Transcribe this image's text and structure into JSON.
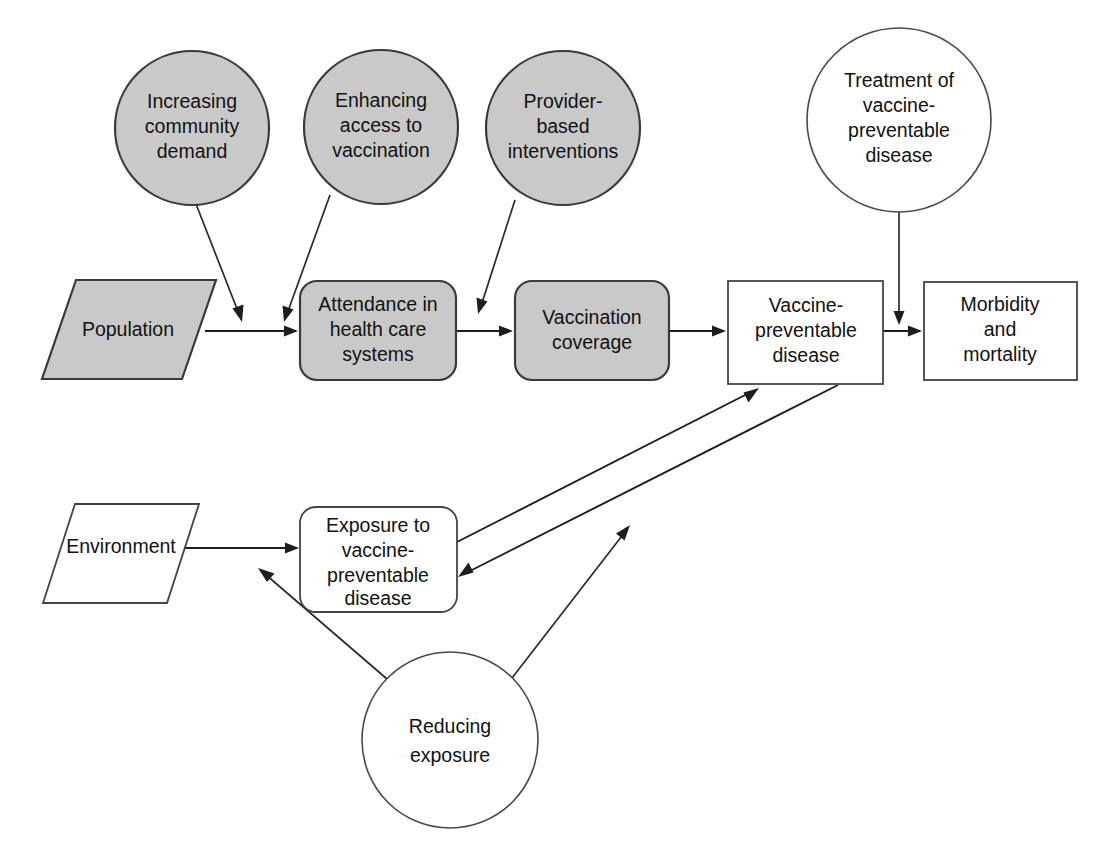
{
  "diagram": {
    "colors": {
      "shaded_fill": "#c9c9c9",
      "plain_fill": "#ffffff",
      "stroke": "#1d1d1d",
      "background": "#ffffff"
    },
    "nodes": {
      "increasing_community_demand": {
        "shape": "circle",
        "fill": "shaded",
        "lines": [
          "Increasing",
          "community",
          "demand"
        ]
      },
      "enhancing_access_to_vaccination": {
        "shape": "circle",
        "fill": "shaded",
        "lines": [
          "Enhancing",
          "access to",
          "vaccination"
        ]
      },
      "provider_based_interventions": {
        "shape": "circle",
        "fill": "shaded",
        "lines": [
          "Provider-",
          "based",
          "interventions"
        ]
      },
      "treatment_of_vpd": {
        "shape": "circle",
        "fill": "plain",
        "lines": [
          "Treatment of",
          "vaccine-",
          "preventable",
          "disease"
        ]
      },
      "reducing_exposure": {
        "shape": "circle",
        "fill": "plain",
        "lines": [
          "Reducing",
          "exposure"
        ]
      },
      "population": {
        "shape": "parallelogram",
        "fill": "shaded",
        "lines": [
          "Population"
        ]
      },
      "attendance_in_health_care_systems": {
        "shape": "rounded-rect",
        "fill": "shaded",
        "lines": [
          "Attendance in",
          "health care",
          "systems"
        ]
      },
      "vaccination_coverage": {
        "shape": "rounded-rect",
        "fill": "shaded",
        "lines": [
          "Vaccination",
          "coverage"
        ]
      },
      "vaccine_preventable_disease": {
        "shape": "rect",
        "fill": "plain",
        "lines": [
          "Vaccine-",
          "preventable",
          "disease"
        ]
      },
      "morbidity_and_mortality": {
        "shape": "rect",
        "fill": "plain",
        "lines": [
          "Morbidity",
          "and",
          "mortality"
        ]
      },
      "environment": {
        "shape": "parallelogram",
        "fill": "plain",
        "lines": [
          "Environment"
        ]
      },
      "exposure_to_vpd": {
        "shape": "rounded-rect",
        "fill": "plain",
        "lines": [
          "Exposure to",
          "vaccine-",
          "preventable",
          "disease"
        ]
      }
    },
    "edges": [
      {
        "name": "population-to-attendance",
        "from": "population",
        "to": "attendance_in_health_care_systems",
        "style": "arrow"
      },
      {
        "name": "demand-to-population-flow",
        "from": "increasing_community_demand",
        "to": "population-to-attendance",
        "style": "arrow"
      },
      {
        "name": "access-to-population-flow",
        "from": "enhancing_access_to_vaccination",
        "to": "population-to-attendance",
        "style": "arrow"
      },
      {
        "name": "provider-to-coverage-flow",
        "from": "provider_based_interventions",
        "to": "attendance-to-coverage",
        "style": "arrow"
      },
      {
        "name": "attendance-to-coverage",
        "from": "attendance_in_health_care_systems",
        "to": "vaccination_coverage",
        "style": "arrow"
      },
      {
        "name": "coverage-to-vpd",
        "from": "vaccination_coverage",
        "to": "vaccine_preventable_disease",
        "style": "arrow"
      },
      {
        "name": "vpd-to-morbidity",
        "from": "vaccine_preventable_disease",
        "to": "morbidity_and_mortality",
        "style": "arrow"
      },
      {
        "name": "treatment-to-vpd-morbidity-flow",
        "from": "treatment_of_vpd",
        "to": "vpd-to-morbidity",
        "style": "arrow"
      },
      {
        "name": "environment-to-exposure",
        "from": "environment",
        "to": "exposure_to_vpd",
        "style": "arrow"
      },
      {
        "name": "exposure-to-vpd",
        "from": "exposure_to_vpd",
        "to": "vaccine_preventable_disease",
        "style": "arrow"
      },
      {
        "name": "vpd-to-exposure",
        "from": "vaccine_preventable_disease",
        "to": "exposure_to_vpd",
        "style": "arrow"
      },
      {
        "name": "reducing-exposure-to-environment-flow",
        "from": "reducing_exposure",
        "to": "environment-to-exposure",
        "style": "arrow"
      },
      {
        "name": "reducing-exposure-to-exposure-vpd-flow",
        "from": "reducing_exposure",
        "to": "exposure-to-vpd",
        "style": "arrow"
      }
    ]
  }
}
